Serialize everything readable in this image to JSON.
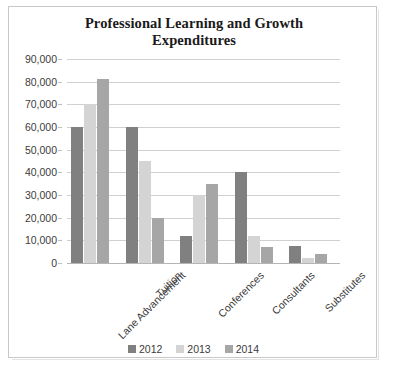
{
  "chart_data": {
    "type": "bar",
    "title": "Professional Learning and Growth Expenditures",
    "title_line1": "Professional Learning and Growth",
    "title_line2": "Expenditures",
    "xlabel": "",
    "ylabel": "",
    "categories": [
      "Lane Advancement",
      "Tuition",
      "Conferences",
      "Consultants",
      "Substitutes"
    ],
    "series": [
      {
        "name": "2012",
        "color": "#808080",
        "values": [
          60000,
          60000,
          12000,
          40000,
          7500
        ]
      },
      {
        "name": "2013",
        "color": "#d4d4d4",
        "values": [
          70000,
          45000,
          30000,
          12000,
          2000
        ]
      },
      {
        "name": "2014",
        "color": "#a6a6a6",
        "values": [
          81000,
          20000,
          35000,
          7000,
          4000
        ]
      }
    ],
    "ylim": [
      0,
      90000
    ],
    "ytick_step": 10000,
    "ytick_labels": [
      "90,000",
      "80,000",
      "70,000",
      "60,000",
      "50,000",
      "40,000",
      "30,000",
      "20,000",
      "10,000",
      "0"
    ],
    "ytick_values": [
      90000,
      80000,
      70000,
      60000,
      50000,
      40000,
      30000,
      20000,
      10000,
      0
    ],
    "grid": true,
    "legend_position": "bottom",
    "legend_entries": [
      "2012",
      "2013",
      "2014"
    ],
    "axis_color": "#c0c0c0",
    "grid_color": "#d0d0d0",
    "text_color": "#3b3b3b",
    "background": "#ffffff"
  }
}
